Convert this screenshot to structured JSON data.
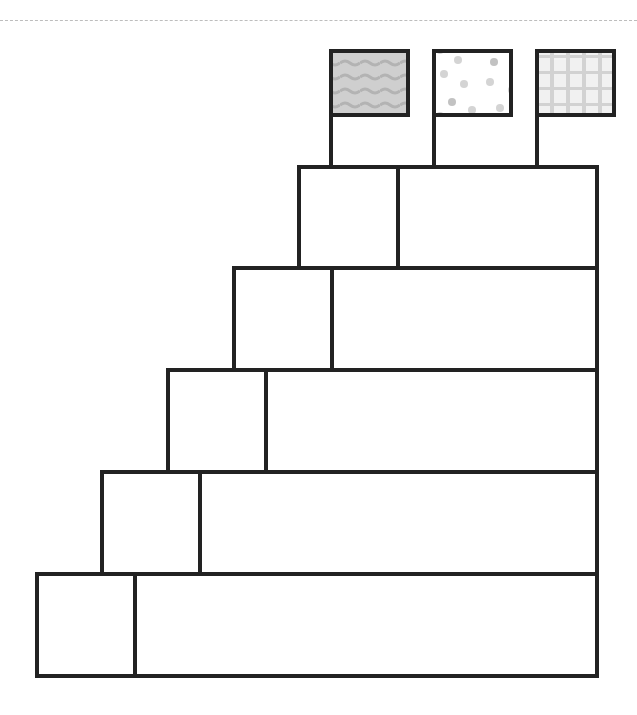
{
  "diagram": {
    "type": "staircase-table-with-flags",
    "stroke_color": "#222222",
    "background": "#ffffff",
    "rows": [
      {
        "left_cell": "",
        "right_cell": ""
      },
      {
        "left_cell": "",
        "right_cell": ""
      },
      {
        "left_cell": "",
        "right_cell": ""
      },
      {
        "left_cell": "",
        "right_cell": ""
      },
      {
        "left_cell": "",
        "right_cell": ""
      }
    ],
    "flags": [
      {
        "pattern": "wavy-lines",
        "fill": "#cfcfcf",
        "pattern_color": "#b5b5b5"
      },
      {
        "pattern": "dots",
        "fill": "#ffffff",
        "pattern_color": "#c8c8c8"
      },
      {
        "pattern": "plaid-grid",
        "fill": "#f1f1f1",
        "pattern_color": "#cdcdcd"
      }
    ]
  }
}
